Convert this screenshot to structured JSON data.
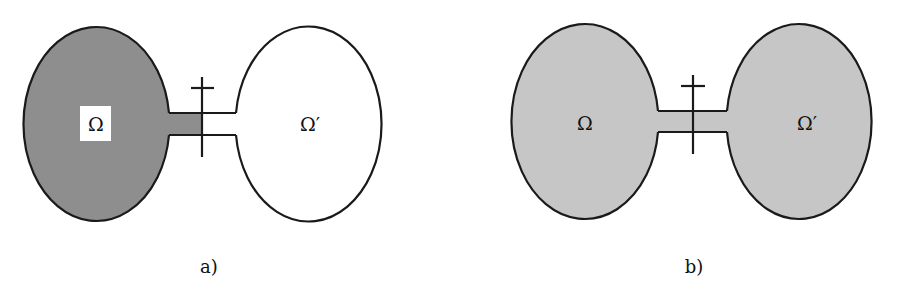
{
  "figure": {
    "colors": {
      "dark_fill": "#8e8e8e",
      "light_fill": "#c6c6c6",
      "stroke": "#1a1a1a",
      "background": "#ffffff"
    },
    "panels": [
      {
        "caption": "a)",
        "left_domain_label": "Ω",
        "right_domain_label": "Ω′",
        "left_fill": "dark",
        "right_fill": "none",
        "left_label_boxed": true
      },
      {
        "caption": "b)",
        "left_domain_label": "Ω",
        "right_domain_label": "Ω′",
        "left_fill": "light",
        "right_fill": "light",
        "left_label_boxed": false
      }
    ]
  }
}
